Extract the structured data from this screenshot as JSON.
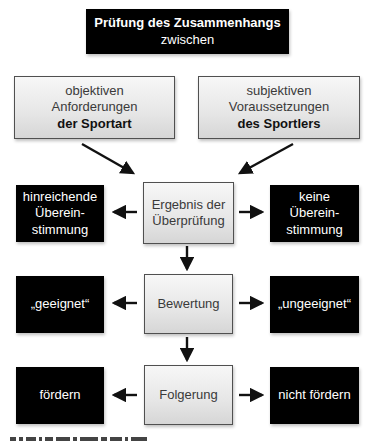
{
  "diagram": {
    "title": {
      "line1": "Prüfung des Zusammenhangs",
      "line2": "zwischen"
    },
    "inputs": [
      {
        "line1": "objektiven",
        "line2": "Anforderungen",
        "line3_bold": "der Sportart"
      },
      {
        "line1": "subjektiven",
        "line2": "Voraussetzungen",
        "line3_bold": "des Sportlers"
      }
    ],
    "rows": [
      {
        "center": {
          "line1": "Ergebnis der",
          "line2": "Überprüfung"
        },
        "left": {
          "line1": "hinreichende",
          "line2": "Überein-",
          "line3": "stimmung"
        },
        "right": {
          "line1": "keine",
          "line2": "Überein-",
          "line3": "stimmung"
        }
      },
      {
        "center": {
          "label": "Bewertung"
        },
        "left": {
          "label": "„geeignet“"
        },
        "right": {
          "label": "„ungeeignet“"
        }
      },
      {
        "center": {
          "label": "Folgerung"
        },
        "left": {
          "label": "fördern"
        },
        "right": {
          "label": "nicht fördern"
        }
      }
    ],
    "colors": {
      "dark_box": "#000000",
      "light_box_top": "#f7f7f7",
      "light_box_bottom": "#d6d6d6",
      "light_box_border": "#505050",
      "arrow": "#111111"
    }
  }
}
